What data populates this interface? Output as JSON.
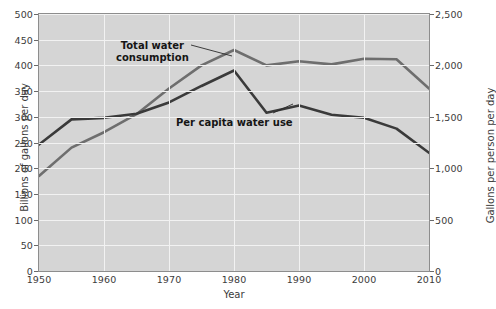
{
  "chart_data": {
    "type": "line",
    "title": "",
    "xlabel": "Year",
    "ylabel": "Billions of gallons per day",
    "ylabel_right": "Gallons per person per day",
    "x": [
      1950,
      1955,
      1960,
      1965,
      1970,
      1975,
      1980,
      1985,
      1990,
      1995,
      2000,
      2005,
      2010
    ],
    "xlim": [
      1950,
      2010
    ],
    "ylim": [
      0,
      500
    ],
    "ylim_right": [
      0,
      2500
    ],
    "xticks": [
      "1950",
      "1960",
      "1970",
      "1980",
      "1990",
      "2000",
      "2010"
    ],
    "xtick_values": [
      1950,
      1960,
      1970,
      1980,
      1990,
      2000,
      2010
    ],
    "yticks_left": [
      "0",
      "50",
      "100",
      "150",
      "200",
      "250",
      "300",
      "350",
      "400",
      "450",
      "500"
    ],
    "ytick_left_values": [
      0,
      50,
      100,
      150,
      200,
      250,
      300,
      350,
      400,
      450,
      500
    ],
    "yticks_right": [
      "0",
      "500",
      "1,000",
      "1,500",
      "2,000",
      "2,500"
    ],
    "ytick_right_values": [
      0,
      500,
      1000,
      1500,
      2000,
      2500
    ],
    "grid": true,
    "legend": "inline-annotations",
    "plot_background": "#d5d5d5",
    "series": [
      {
        "name": "Total water consumption",
        "axis": "left",
        "color": "#6e6e6e",
        "values": [
          185,
          240,
          270,
          305,
          355,
          400,
          430,
          400,
          408,
          402,
          413,
          412,
          355
        ]
      },
      {
        "name": "Per capita water use",
        "axis": "right",
        "color": "#3a3a3a",
        "values": [
          1230,
          1475,
          1490,
          1530,
          1640,
          1800,
          1950,
          1540,
          1610,
          1520,
          1490,
          1385,
          1150
        ]
      }
    ],
    "annotations": [
      {
        "id": "total-water-consumption",
        "line1": "Total water",
        "line2": "consumption"
      },
      {
        "id": "per-capita-water-use",
        "line1": "Per capita water use",
        "line2": ""
      }
    ]
  }
}
